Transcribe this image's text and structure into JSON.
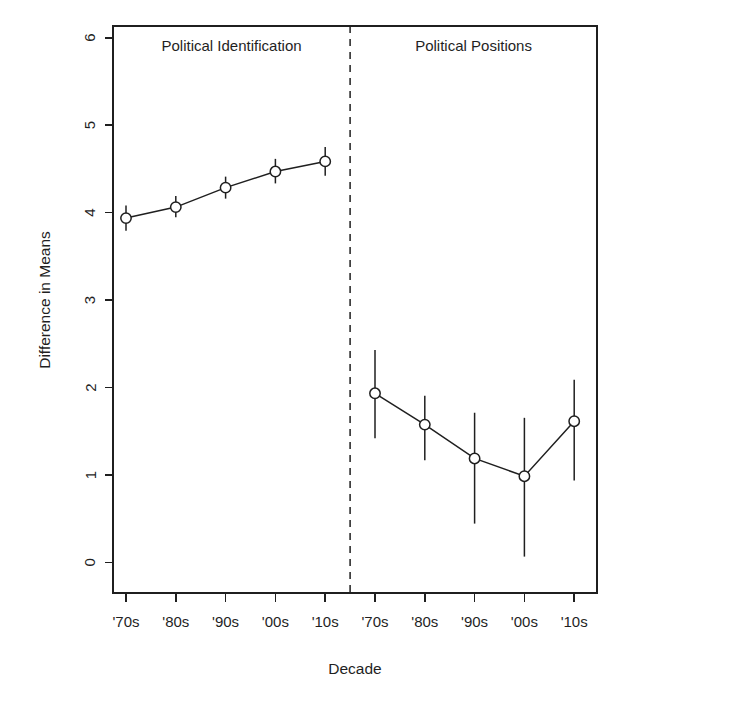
{
  "chart_data": {
    "type": "line",
    "title": "",
    "xlabel": "Decade",
    "ylabel": "Difference in Means",
    "ylim": [
      -0.35,
      6.35
    ],
    "yticks": [
      0,
      1,
      2,
      3,
      4,
      5,
      6
    ],
    "ytick_labels": [
      "0",
      "1",
      "2",
      "3",
      "4",
      "5",
      "6"
    ],
    "grid": false,
    "legend": "none",
    "error_bars": "95% confidence interval",
    "panels": [
      {
        "name": "political-identification",
        "label": "Political Identification",
        "categories": [
          "'70s",
          "'80s",
          "'90s",
          "'00s",
          "'10s"
        ],
        "values": [
          4.08,
          4.21,
          4.44,
          4.63,
          4.75
        ],
        "ci_low": [
          3.93,
          4.09,
          4.31,
          4.49,
          4.58
        ],
        "ci_high": [
          4.23,
          4.34,
          4.57,
          4.78,
          4.92
        ]
      },
      {
        "name": "political-positions",
        "label": "Political Positions",
        "categories": [
          "'70s",
          "'80s",
          "'90s",
          "'00s",
          "'10s"
        ],
        "values": [
          2.01,
          1.64,
          1.24,
          1.03,
          1.68
        ],
        "ci_low": [
          1.48,
          1.22,
          0.47,
          0.08,
          0.98
        ],
        "ci_high": [
          2.52,
          1.98,
          1.78,
          1.72,
          2.17
        ]
      }
    ],
    "xtick_labels": [
      "'70s",
      "'80s",
      "'90s",
      "'00s",
      "'10s",
      "'70s",
      "'80s",
      "'90s",
      "'00s",
      "'10s"
    ],
    "divider": {
      "present": true,
      "style": "dashed",
      "between": [
        "Political Identification",
        "Political Positions"
      ]
    }
  },
  "axes": {
    "y_title": "Difference in Means",
    "x_title": "Decade"
  }
}
